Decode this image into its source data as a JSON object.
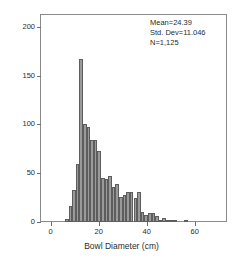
{
  "chart_data": {
    "type": "bar",
    "title": "",
    "subtitle": "",
    "xlabel": "Bowl Diameter (cm)",
    "ylabel": "Frequency",
    "xlim": [
      -4,
      73
    ],
    "ylim": [
      0,
      212
    ],
    "grid": false,
    "legend": null,
    "bin_width": 1.5,
    "bar_color": "#9a9a9a",
    "bar_edge_color": "#5d5d5d",
    "xticks": [
      0,
      20,
      40,
      60
    ],
    "xtick_labels": [
      "0",
      "20",
      "40",
      "60"
    ],
    "yticks": [
      0,
      50,
      100,
      150,
      200
    ],
    "ytick_labels": [
      "0",
      "50",
      "100",
      "150",
      "200"
    ],
    "bin_centers": [
      6.75,
      8.25,
      9.75,
      11.25,
      12.75,
      14.25,
      15.75,
      17.25,
      18.75,
      20.25,
      21.75,
      23.25,
      24.75,
      26.25,
      27.75,
      29.25,
      30.75,
      32.25,
      33.75,
      35.25,
      36.75,
      38.25,
      39.75,
      41.25,
      42.75,
      44.25,
      45.75,
      47.25,
      48.75,
      50.25,
      51.75,
      53.25,
      54.75,
      56.25,
      57.75,
      59.25,
      60.75,
      62.25,
      63.75,
      65.25,
      66.75
    ],
    "values": [
      3,
      16,
      33,
      59,
      167,
      100,
      97,
      84,
      84,
      73,
      45,
      44,
      47,
      36,
      39,
      26,
      28,
      31,
      31,
      25,
      31,
      10,
      7,
      9,
      9,
      6,
      2,
      4,
      2,
      1,
      1,
      0,
      0,
      1,
      0,
      0,
      0,
      0,
      0,
      0,
      0
    ],
    "annotations": {
      "mean": "Mean=24.39",
      "std_dev": "Std. Dev=11.046",
      "n": "N=1,125"
    }
  }
}
